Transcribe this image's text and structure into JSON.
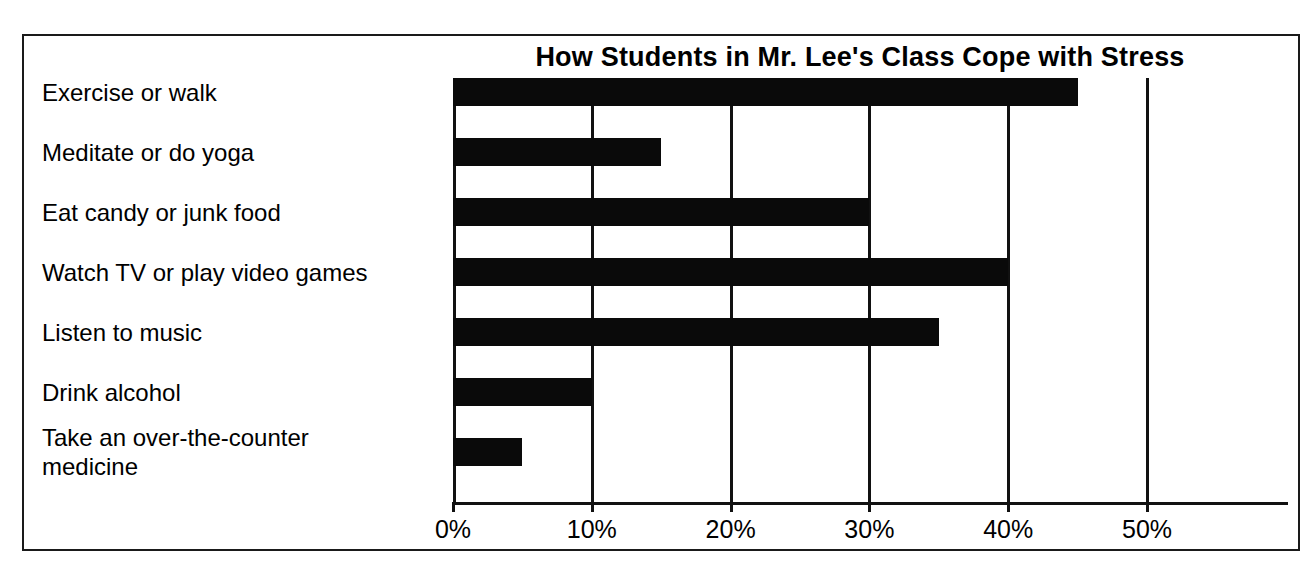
{
  "chart_data": {
    "type": "bar",
    "orientation": "horizontal",
    "title": "How Students in Mr. Lee's Class Cope with Stress",
    "xlabel": "",
    "ylabel": "",
    "xlim": [
      0,
      60
    ],
    "grid": true,
    "legend": null,
    "categories": [
      "Exercise or walk",
      "Meditate or do yoga",
      "Eat candy or junk food",
      "Watch TV or play video games",
      "Listen to music",
      "Drink alcohol",
      "Take an over-the-counter\nmedicine"
    ],
    "values": [
      45,
      15,
      30,
      40,
      35,
      10,
      5
    ],
    "value_unit": "%",
    "tick_values": [
      0,
      10,
      20,
      30,
      40,
      50
    ],
    "tick_labels": [
      "0%",
      "10%",
      "20%",
      "30%",
      "40%",
      "50%"
    ],
    "bar_color": "#0a0a0a",
    "frame_color": "#1a1a1a",
    "background_color": "#ffffff"
  }
}
